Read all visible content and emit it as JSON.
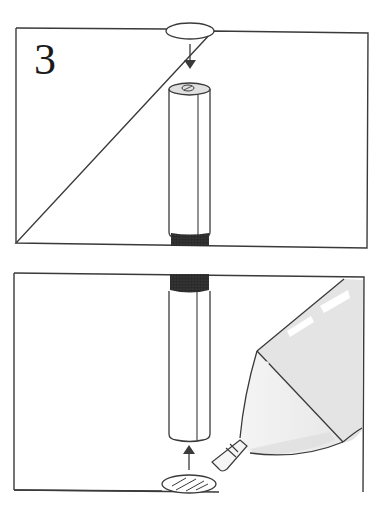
{
  "figure": {
    "step_number": "3",
    "panels": [
      {
        "id": "top-panel",
        "description": "Cylindrical stick with dark band at bottom; oval piece above with downward arrow pointing to stick top",
        "frame": {
          "x": 16,
          "y": 27,
          "w": 352,
          "h": 220
        },
        "arrow_direction": "down"
      },
      {
        "id": "bottom-panel",
        "description": "Cylindrical stick with dark band at top; hatched oval below with upward arrow; glue bottle nozzle applying to oval",
        "frame": {
          "x": 12,
          "y": 272,
          "w": 352,
          "h": 220
        },
        "arrow_direction": "up"
      }
    ],
    "colors": {
      "line": "#3a3a3a",
      "band": "#2b2b2b",
      "bottle_fill": "#e4e4e4",
      "cap_fill": "#e0e0e0",
      "background": "#ffffff"
    }
  }
}
